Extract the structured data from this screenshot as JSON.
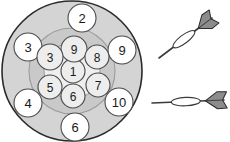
{
  "figure": {
    "kind": "dartboard-packing-diagram",
    "background_color": "#ffffff",
    "board": {
      "name": "dartboard",
      "center_x": 72,
      "center_y": 71,
      "outer_radius": 70,
      "outer_fill": "#d4d4d4",
      "outer_stroke": "#2b2b2b",
      "outer_stroke_width": 1.6,
      "middle_radius": 43,
      "middle_fill": "#c9c9c9",
      "middle_stroke": "#9a9a9a",
      "middle_stroke_width": 1.1,
      "inner_radius": 28,
      "inner_fill": "#efefef",
      "inner_stroke": "#9a9a9a",
      "inner_stroke_width": 1.0
    },
    "circle_style": {
      "fill": "#ffffff",
      "stroke": "#4a4a4a",
      "stroke_width": 1.1,
      "label_color": "#1a1a1a"
    },
    "inner_circle_style": {
      "fill": "#ededed",
      "stroke": "#4a4a4a",
      "stroke_width": 1.1,
      "label_color": "#1a1a1a"
    },
    "outer_ring_circles": [
      {
        "name": "circle-2",
        "label": "2",
        "cx": 82,
        "cy": 18,
        "r": 14,
        "font_size": 13
      },
      {
        "name": "circle-3-outer",
        "label": "3",
        "cx": 28,
        "cy": 47,
        "r": 14,
        "font_size": 13
      },
      {
        "name": "circle-9-outer",
        "label": "9",
        "cx": 122,
        "cy": 50,
        "r": 14,
        "font_size": 13
      },
      {
        "name": "circle-4",
        "label": "4",
        "cx": 28,
        "cy": 103,
        "r": 14,
        "font_size": 13
      },
      {
        "name": "circle-10",
        "label": "10",
        "cx": 119,
        "cy": 102,
        "r": 14,
        "font_size": 13
      },
      {
        "name": "circle-6-outer",
        "label": "6",
        "cx": 75,
        "cy": 127,
        "r": 14,
        "font_size": 13
      }
    ],
    "inner_cluster_circles": [
      {
        "name": "circle-1",
        "label": "1",
        "cx": 73,
        "cy": 71,
        "r": 12,
        "font_size": 12
      },
      {
        "name": "circle-9-inner",
        "label": "9",
        "cx": 74,
        "cy": 49,
        "r": 13,
        "font_size": 12
      },
      {
        "name": "circle-8",
        "label": "8",
        "cx": 97,
        "cy": 57,
        "r": 12,
        "font_size": 12
      },
      {
        "name": "circle-7",
        "label": "7",
        "cx": 98,
        "cy": 85,
        "r": 12,
        "font_size": 12
      },
      {
        "name": "circle-6-inner",
        "label": "6",
        "cx": 73,
        "cy": 96,
        "r": 12,
        "font_size": 12
      },
      {
        "name": "circle-5",
        "label": "5",
        "cx": 50,
        "cy": 87,
        "r": 12,
        "font_size": 12
      },
      {
        "name": "circle-3-inner",
        "label": "3",
        "cx": 50,
        "cy": 57,
        "r": 13,
        "font_size": 12
      }
    ],
    "darts": [
      {
        "name": "dart-upper",
        "orientation": "diagonal",
        "shaft_color": "#3a3a3a",
        "flight_fill": "#8c8c8c",
        "flight_stroke": "#2b2b2b",
        "barrel_fill": "#ffffff",
        "barrel_stroke": "#3a3a3a",
        "tip_x": 159,
        "tip_y": 58,
        "tail_x": 212,
        "tail_y": 18
      },
      {
        "name": "dart-lower",
        "orientation": "horizontal",
        "shaft_color": "#3a3a3a",
        "flight_fill": "#8c8c8c",
        "flight_stroke": "#2b2b2b",
        "barrel_fill": "#ffffff",
        "barrel_stroke": "#3a3a3a",
        "tip_x": 152,
        "tip_y": 103,
        "tail_x": 224,
        "tail_y": 100
      }
    ]
  }
}
